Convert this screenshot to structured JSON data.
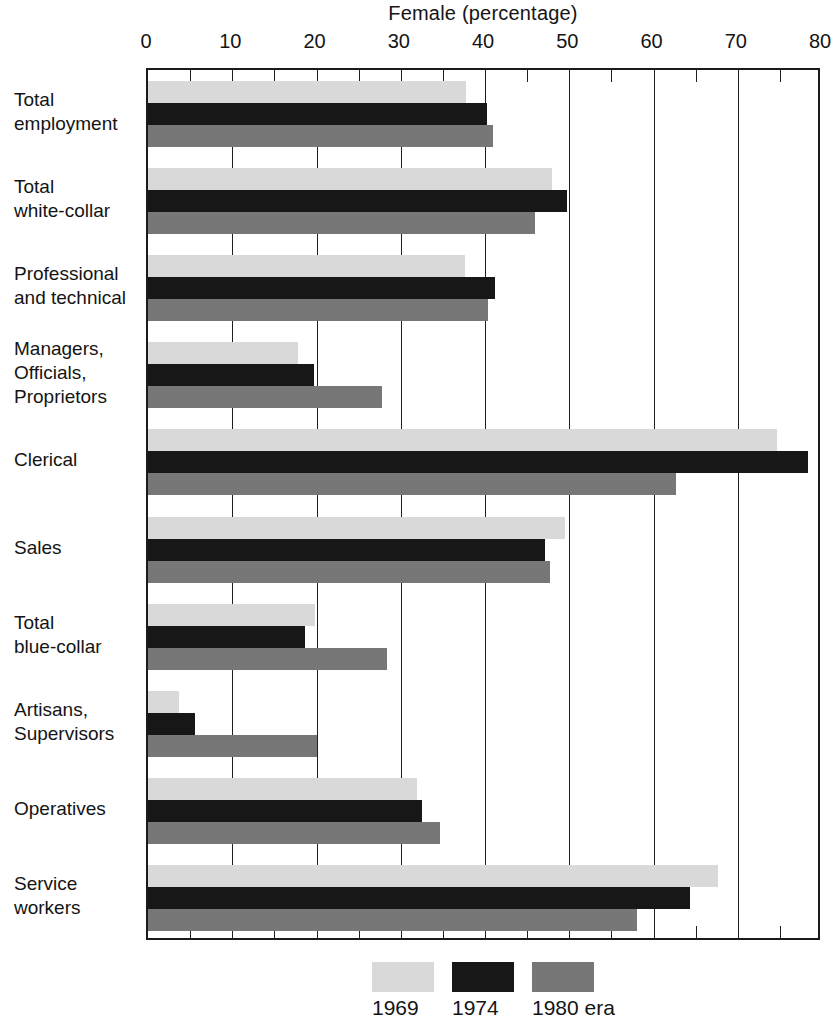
{
  "chart_data": {
    "type": "bar",
    "orientation": "horizontal",
    "title": "Female (percentage)",
    "xlabel": "",
    "ylabel": "",
    "xlim": [
      0,
      80
    ],
    "xticks": [
      0,
      10,
      20,
      30,
      40,
      50,
      60,
      70,
      80
    ],
    "minor_tick_step": 5,
    "grid": "vertical gridlines at every 10 units",
    "legend_position": "bottom-center",
    "categories": [
      "Total employment",
      "Total white-collar",
      "Professional and technical",
      "Managers, Officials, Proprietors",
      "Clerical",
      "Sales",
      "Total blue-collar",
      "Artisans, Supervisors",
      "Operatives",
      "Service workers"
    ],
    "series": [
      {
        "name": "1969",
        "color": "#d9d9d9",
        "values": [
          37.8,
          48.0,
          37.6,
          17.8,
          74.7,
          49.5,
          19.8,
          3.7,
          31.9,
          67.6
        ]
      },
      {
        "name": "1974",
        "color": "#171717",
        "values": [
          40.2,
          49.7,
          41.2,
          19.7,
          78.3,
          47.1,
          18.6,
          5.6,
          32.5,
          64.3
        ]
      },
      {
        "name": "1980 era",
        "color": "#777777",
        "values": [
          41.0,
          45.9,
          40.4,
          27.8,
          62.7,
          47.7,
          28.4,
          20.0,
          34.7,
          58.0
        ]
      }
    ]
  },
  "category_labels": [
    [
      "Total",
      "employment"
    ],
    [
      "Total",
      "white-collar"
    ],
    [
      "Professional",
      "and technical"
    ],
    [
      "Managers,",
      "Officials,",
      "Proprietors"
    ],
    [
      "Clerical"
    ],
    [
      "Sales"
    ],
    [
      "Total",
      "blue-collar"
    ],
    [
      "Artisans,",
      "Supervisors"
    ],
    [
      "Operatives"
    ],
    [
      "Service",
      "workers"
    ]
  ],
  "legend": {
    "entries": [
      {
        "label": "1969",
        "color": "#d9d9d9"
      },
      {
        "label": "1974",
        "color": "#171717"
      },
      {
        "label": "1980 era",
        "color": "#777777"
      }
    ]
  }
}
